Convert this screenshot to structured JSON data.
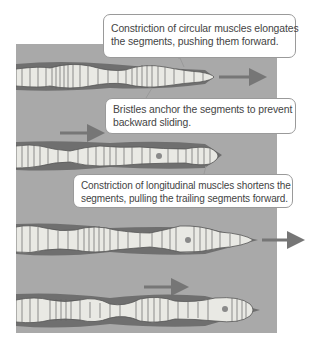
{
  "diagram": {
    "colors": {
      "background": "#ffffff",
      "soil": "#a9a9a9",
      "burrow": "#6f6f6f",
      "worm_body": "#e9e9e4",
      "worm_outline": "#555555",
      "arrow": "#767676",
      "callout_border": "#9a9a9a",
      "text": "#444444"
    },
    "callouts": [
      {
        "id": "circular-muscles",
        "lines": [
          "Constriction of circular muscles elongates",
          "the segments, pushing them forward."
        ]
      },
      {
        "id": "bristles",
        "lines": [
          "Bristles anchor the segments to prevent",
          "backward sliding."
        ]
      },
      {
        "id": "longitudinal-muscles",
        "lines": [
          "Constriction of longitudinal muscles shortens the",
          "segments, pulling the trailing segments forward."
        ]
      }
    ],
    "worms": [
      {
        "stage": 1,
        "head_x": 212,
        "y": 77,
        "arrow": "right of head"
      },
      {
        "stage": 2,
        "head_x": 218,
        "y": 155,
        "arrow": "above worm"
      },
      {
        "stage": 3,
        "head_x": 253,
        "y": 240,
        "arrow": "right of head, outside panel"
      },
      {
        "stage": 4,
        "head_x": 256,
        "y": 310,
        "arrow": "above worm"
      }
    ]
  }
}
